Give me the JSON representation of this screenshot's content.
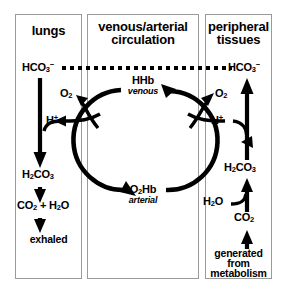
{
  "diagram": {
    "colors": {
      "ink": "#000000",
      "panel_border": "#9a9a9a",
      "background": "#ffffff"
    },
    "panels": [
      {
        "id": "lungs",
        "title": "lungs"
      },
      {
        "id": "circulation",
        "title_line1": "venous/arterial",
        "title_line2": "circulation"
      },
      {
        "id": "tissues",
        "title_line1": "peripheral",
        "title_line2": "tissues"
      }
    ],
    "lungs": {
      "bicarbonate": "HCO3-",
      "proton": "H+",
      "carbonic_acid": "H2CO3",
      "products": "CO2 + H2O",
      "outcome": "exhaled",
      "oxygen": "O2"
    },
    "circulation": {
      "deoxy_label": "HHb",
      "deoxy_state": "venous",
      "oxy_label": "O2Hb",
      "oxy_state": "arterial"
    },
    "tissues": {
      "bicarbonate": "HCO3-",
      "oxygen": "O2",
      "proton": "H+",
      "carbonic_acid": "H2CO3",
      "water": "H2O",
      "carbon_dioxide": "CO2",
      "source_line1": "generated",
      "source_line2": "from",
      "source_line3": "metabolism"
    }
  }
}
